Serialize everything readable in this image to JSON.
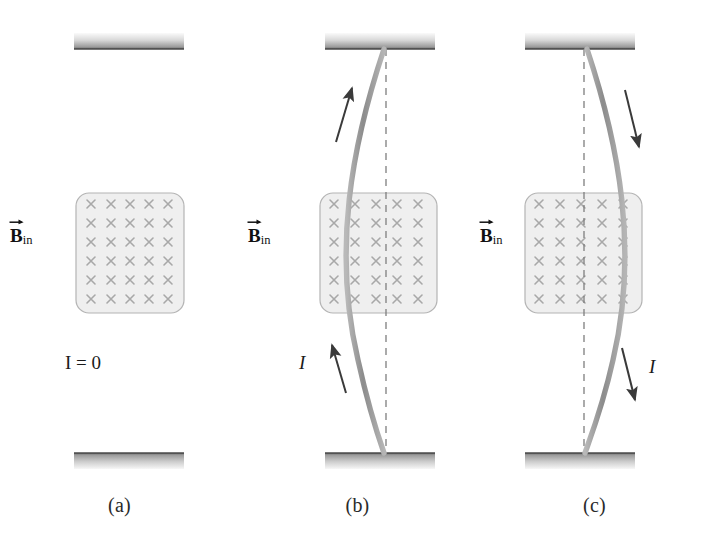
{
  "figure": {
    "colors": {
      "wire": "#9a9a9a",
      "wire_dark": "#8a8a8a",
      "box_fill": "#efefef",
      "box_stroke": "#b4b4b4",
      "cross": "#a8a8a8",
      "support_light": "#f2f2f2",
      "support_dark": "#6e6e6e",
      "arrow": "#3a3a3a",
      "dashed": "#808080",
      "text": "#1a1a1a"
    },
    "field_grid": {
      "columns": 5,
      "rows": 6,
      "symbol": "×"
    }
  },
  "panels": [
    {
      "id": "a",
      "caption": "(a)",
      "bfield_label": {
        "symbol": "B",
        "subscript": "in",
        "vector": true
      },
      "current_label": {
        "text": "I = 0",
        "italic_part": "I"
      },
      "wire_state": "straight",
      "current_direction": "none",
      "arrows": []
    },
    {
      "id": "b",
      "caption": "(b)",
      "bfield_label": {
        "symbol": "B",
        "subscript": "in",
        "vector": true
      },
      "current_label": {
        "text": "I",
        "italic_part": "I"
      },
      "wire_state": "bowed-left",
      "current_direction": "up",
      "arrows": [
        {
          "name": "upper-current-arrow",
          "direction": "up"
        },
        {
          "name": "lower-current-arrow",
          "direction": "up"
        }
      ]
    },
    {
      "id": "c",
      "caption": "(c)",
      "bfield_label": {
        "symbol": "B",
        "subscript": "in",
        "vector": true
      },
      "current_label": {
        "text": "I",
        "italic_part": "I"
      },
      "wire_state": "bowed-right",
      "current_direction": "down",
      "arrows": [
        {
          "name": "upper-current-arrow",
          "direction": "down"
        },
        {
          "name": "lower-current-arrow",
          "direction": "down"
        }
      ]
    }
  ]
}
